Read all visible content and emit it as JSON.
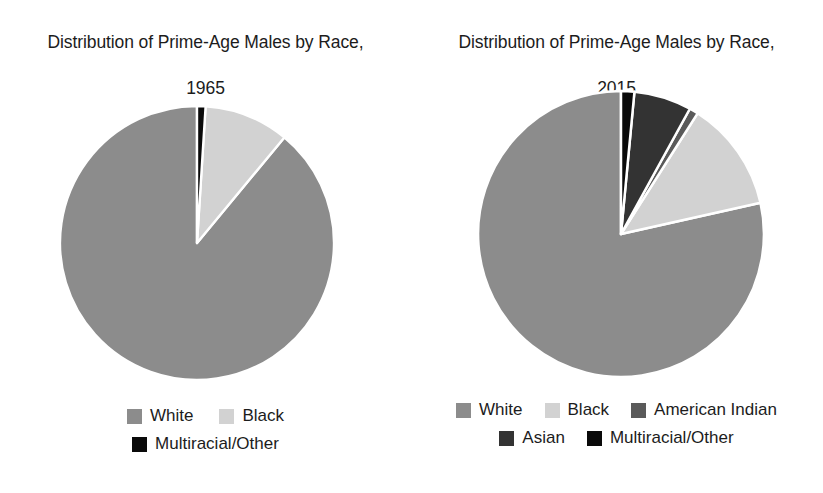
{
  "chart_data": [
    {
      "type": "pie",
      "title": "Distribution of Prime-Age Males by Race,\n1965",
      "title_line1": "Distribution of Prime-Age Males by Race,",
      "title_line2": "1965",
      "year": "1965",
      "categories": [
        "White",
        "Black",
        "Multiracial/Other"
      ],
      "values": [
        89.0,
        10.0,
        1.0
      ],
      "unit": "percent",
      "colors": [
        "#8c8c8c",
        "#d2d2d2",
        "#0a0a0a"
      ],
      "start_angle_deg": 90,
      "direction": "counterclockwise",
      "slice_border": "#ffffff",
      "legend_position": "bottom",
      "legend_rows": [
        [
          "White",
          "Black"
        ],
        [
          "Multiracial/Other"
        ]
      ]
    },
    {
      "type": "pie",
      "title": "Distribution of Prime-Age Males by Race,\n2015",
      "title_line1": "Distribution of Prime-Age Males by Race,",
      "title_line2": "2015",
      "year": "2015",
      "categories": [
        "White",
        "Black",
        "American Indian",
        "Asian",
        "Multiracial/Other"
      ],
      "values": [
        78.5,
        12.5,
        1.0,
        6.5,
        1.5
      ],
      "unit": "percent",
      "colors": [
        "#8c8c8c",
        "#d2d2d2",
        "#5a5a5a",
        "#333333",
        "#0a0a0a"
      ],
      "start_angle_deg": 90,
      "direction": "counterclockwise",
      "slice_border": "#ffffff",
      "legend_position": "bottom",
      "legend_rows": [
        [
          "White",
          "Black",
          "American Indian"
        ],
        [
          "Asian",
          "Multiracial/Other"
        ]
      ]
    }
  ],
  "left_chart": {
    "title_line1": "Distribution of Prime-Age Males by Race,",
    "title_line2": "1965",
    "legend": {
      "row1": [
        {
          "label": "White",
          "color": "#8c8c8c"
        },
        {
          "label": "Black",
          "color": "#d2d2d2"
        }
      ],
      "row2": [
        {
          "label": "Multiracial/Other",
          "color": "#0a0a0a"
        }
      ]
    }
  },
  "right_chart": {
    "title_line1": "Distribution of Prime-Age Males by Race,",
    "title_line2": "2015",
    "legend": {
      "row1": [
        {
          "label": "White",
          "color": "#8c8c8c"
        },
        {
          "label": "Black",
          "color": "#d2d2d2"
        },
        {
          "label": "American Indian",
          "color": "#5a5a5a"
        }
      ],
      "row2": [
        {
          "label": "Asian",
          "color": "#333333"
        },
        {
          "label": "Multiracial/Other",
          "color": "#0a0a0a"
        }
      ]
    }
  }
}
